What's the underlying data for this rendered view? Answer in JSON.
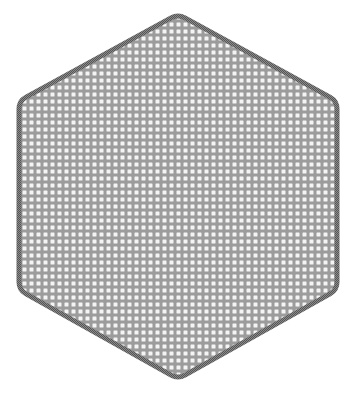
{
  "canvas": {
    "width": 356,
    "height": 393,
    "background": "#ffffff"
  },
  "shape": {
    "type": "hexagon",
    "orientation": "pointy-top",
    "vertices": [
      [
        178,
        14
      ],
      [
        337,
        101
      ],
      [
        337,
        290
      ],
      [
        178,
        379
      ],
      [
        19,
        290
      ],
      [
        19,
        101
      ]
    ],
    "corner_radius": 8,
    "fill_color": "#9c9c9c",
    "border_color": "#6e6e6e",
    "border_width": 5
  },
  "pattern": {
    "type": "dot-grid",
    "spacing": 7,
    "dot_size": 4,
    "dot_color": "#f4f4f4",
    "rotation_deg": 0
  }
}
